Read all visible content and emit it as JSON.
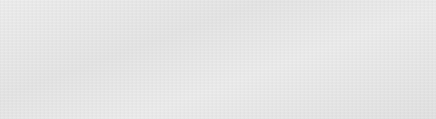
{
  "canvas": {
    "width": 436,
    "height": 119,
    "background_color": "#e9e9e9",
    "panel": {
      "fill": "#ffffff",
      "border_color": "#6e6e6e",
      "x": 18,
      "y": 12,
      "width": 400,
      "height": 96
    }
  },
  "colors": {
    "stroke_dark": "#1f1f1f",
    "stroke_gray": "#8a8a8a",
    "arrow_fill": "#2b2b2b",
    "cylinder_stroke": "#555555",
    "text": "#1f1f1f",
    "shape_fill": "#ffffff"
  },
  "diagram": {
    "nodes": [
      {
        "id": "validate-transaction",
        "type": "process-box",
        "lines": [
          "Validate",
          "Transaction",
          "(Invokes",
          "Check",
          "Balance)"
        ]
      },
      {
        "id": "account-transaction",
        "type": "document",
        "lines": [
          "Account",
          "Transaction"
        ]
      },
      {
        "id": "debit-account",
        "type": "process-box",
        "lines": [
          "Debit",
          "Account"
        ]
      },
      {
        "id": "pipeline-distributor",
        "type": "circle",
        "lines": [
          "Pipeline",
          "Distributor",
          "E"
        ]
      },
      {
        "id": "db-shard",
        "type": "database-stack",
        "count": 3,
        "lines": [
          "DB",
          "Shard"
        ]
      }
    ],
    "connectors": [
      {
        "id": "account-to-debit",
        "from": "account-transaction",
        "to": "debit-account",
        "style": "solid-arrow"
      },
      {
        "id": "debit-to-distributor",
        "from": "debit-account",
        "to": "pipeline-distributor",
        "style": "solid-arrow"
      },
      {
        "id": "distributor-to-shard-1",
        "from": "pipeline-distributor",
        "to": "db-shard",
        "style": "solid-arrow"
      },
      {
        "id": "distributor-to-shard-2",
        "from": "pipeline-distributor",
        "to": "db-shard",
        "style": "solid-arrow"
      },
      {
        "id": "distributor-to-shard-3",
        "from": "pipeline-distributor",
        "to": "db-shard",
        "style": "solid-arrow"
      }
    ]
  }
}
